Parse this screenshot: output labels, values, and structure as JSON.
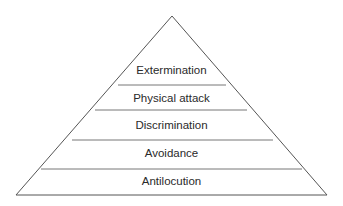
{
  "diagram": {
    "type": "pyramid",
    "line_color": "#555555",
    "levels_top_to_bottom": [
      {
        "label": "Extermination"
      },
      {
        "label": "Physical attack"
      },
      {
        "label": "Discrimination"
      },
      {
        "label": "Avoidance"
      },
      {
        "label": "Antilocution"
      }
    ]
  }
}
